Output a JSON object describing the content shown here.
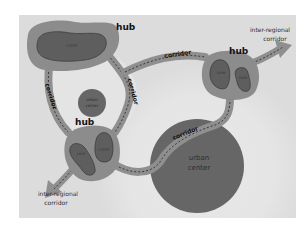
{
  "diagram": {
    "type": "network-corridors-hubs",
    "colors": {
      "background": "#ffffff",
      "panel": "#dcdcdc",
      "halo_outer": "#e4e4e4",
      "halo_inner": "#ececec",
      "hub_fill": "#8c8c8c",
      "core_fill": "#5e5e5e",
      "core_stroke": "#2e2e2e",
      "urban_center_fill": "#666666",
      "corridor_fill": "#8f8f8f",
      "corridor_dash": "#3a3a3a",
      "text_dark": "#111111",
      "text_mid": "#3a3a3a"
    },
    "hubs": [
      {
        "id": "hub-top-left",
        "label": "hub",
        "cores": [
          {
            "label": "core"
          }
        ]
      },
      {
        "id": "hub-right",
        "label": "hub",
        "cores": [
          {
            "label": "core"
          },
          {
            "label": "core"
          }
        ]
      },
      {
        "id": "hub-bottom-left",
        "label": "hub",
        "cores": [
          {
            "label": "core"
          },
          {
            "label": "core"
          }
        ]
      }
    ],
    "urban_centers": [
      {
        "id": "urban-center-small",
        "label_line1": "urban",
        "label_line2": "center"
      },
      {
        "id": "urban-center-large",
        "label_line1": "urban",
        "label_line2": "center"
      }
    ],
    "corridor_labels": {
      "left": "corridor",
      "middle": "corridor",
      "top": "corridor",
      "bottom": "corridor"
    },
    "inter_regional": {
      "top_right_line1": "inter-regional",
      "top_right_line2": "corridor",
      "bottom_left_line1": "inter-regional",
      "bottom_left_line2": "corridor"
    }
  }
}
